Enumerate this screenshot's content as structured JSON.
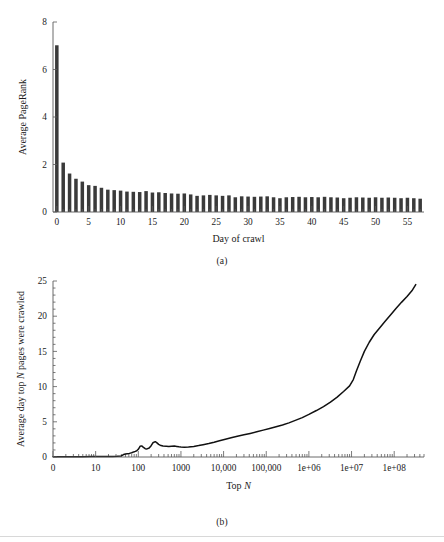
{
  "figure": {
    "panel_a_caption": "(a)",
    "panel_b_caption": "(b)"
  },
  "chart_data": [
    {
      "id": "panel-a",
      "type": "bar",
      "title": "",
      "xlabel": "Day of crawl",
      "ylabel": "Average PageRank",
      "xlim": [
        -0.6,
        57.6
      ],
      "ylim": [
        0,
        8
      ],
      "grid": false,
      "legend": "none",
      "bar_color": "#3a3a3a",
      "xticks": [
        0,
        5,
        10,
        15,
        20,
        25,
        30,
        35,
        40,
        45,
        50,
        55
      ],
      "xticklabels": [
        "0",
        "5",
        "10",
        "15",
        "20",
        "25",
        "30",
        "35",
        "40",
        "45",
        "50",
        "55"
      ],
      "xminorticks": [
        1,
        2,
        3,
        4,
        6,
        7,
        8,
        9,
        11,
        12,
        13,
        14,
        16,
        17,
        18,
        19,
        21,
        22,
        23,
        24,
        26,
        27,
        28,
        29,
        31,
        32,
        33,
        34,
        36,
        37,
        38,
        39,
        41,
        42,
        43,
        44,
        46,
        47,
        48,
        49,
        51,
        52,
        53,
        54,
        56,
        57
      ],
      "yticks": [
        0,
        2,
        4,
        6,
        8
      ],
      "yticklabels": [
        "0",
        "2",
        "4",
        "6",
        "8"
      ],
      "categories": [
        0,
        1,
        2,
        3,
        4,
        5,
        6,
        7,
        8,
        9,
        10,
        11,
        12,
        13,
        14,
        15,
        16,
        17,
        18,
        19,
        20,
        21,
        22,
        23,
        24,
        25,
        26,
        27,
        28,
        29,
        30,
        31,
        32,
        33,
        34,
        35,
        36,
        37,
        38,
        39,
        40,
        41,
        42,
        43,
        44,
        45,
        46,
        47,
        48,
        49,
        50,
        51,
        52,
        53,
        54,
        55,
        56,
        57
      ],
      "values": [
        7.02,
        2.08,
        1.62,
        1.4,
        1.28,
        1.13,
        1.1,
        1.02,
        0.94,
        0.92,
        0.9,
        0.86,
        0.85,
        0.84,
        0.88,
        0.82,
        0.83,
        0.8,
        0.78,
        0.77,
        0.78,
        0.74,
        0.68,
        0.7,
        0.72,
        0.7,
        0.68,
        0.7,
        0.62,
        0.66,
        0.65,
        0.64,
        0.65,
        0.66,
        0.62,
        0.58,
        0.62,
        0.63,
        0.64,
        0.62,
        0.63,
        0.62,
        0.64,
        0.62,
        0.61,
        0.58,
        0.6,
        0.62,
        0.61,
        0.6,
        0.62,
        0.6,
        0.61,
        0.6,
        0.58,
        0.6,
        0.58,
        0.56
      ]
    },
    {
      "id": "panel-b",
      "type": "line",
      "title": "",
      "xlabel": "Top N",
      "ylabel": "Average day top N pages were crawled",
      "xscale": "log",
      "xlim": [
        1,
        500000000
      ],
      "ylim": [
        0,
        25
      ],
      "grid": false,
      "legend": "none",
      "line_color": "#111111",
      "xticks": [
        1,
        10,
        100,
        1000,
        10000,
        100000,
        1000000,
        10000000,
        100000000
      ],
      "xticklabels": [
        "0",
        "10",
        "100",
        "1000",
        "10,000",
        "100,000",
        "1e+06",
        "1e+07",
        "1e+08"
      ],
      "yticks": [
        0,
        5,
        10,
        15,
        20,
        25
      ],
      "yticklabels": [
        "0",
        "5",
        "10",
        "15",
        "20",
        "25"
      ],
      "x": [
        1,
        2,
        3,
        5,
        8,
        12,
        18,
        25,
        32,
        40,
        45,
        50,
        55,
        60,
        65,
        70,
        78,
        85,
        92,
        100,
        110,
        120,
        130,
        145,
        160,
        180,
        200,
        220,
        250,
        270,
        300,
        340,
        380,
        450,
        520,
        600,
        700,
        800,
        900,
        1000,
        1200,
        1500,
        2000,
        2600,
        3300,
        4500,
        6000,
        8000,
        11000,
        15000,
        21000,
        30000,
        42000,
        60000,
        85000,
        120000,
        170000,
        240000,
        340000,
        480000,
        700000,
        1000000,
        1500000,
        2200000,
        3200000,
        4600000,
        6500000,
        9000000,
        11000000,
        13000000,
        16000000,
        20000000,
        26000000,
        34000000,
        45000000,
        60000000,
        80000000,
        110000000,
        150000000,
        200000000,
        260000000,
        320000000
      ],
      "y": [
        0.05,
        0.05,
        0.05,
        0.05,
        0.06,
        0.06,
        0.07,
        0.08,
        0.1,
        0.15,
        0.35,
        0.42,
        0.45,
        0.48,
        0.55,
        0.6,
        0.72,
        0.8,
        0.88,
        1.1,
        1.52,
        1.58,
        1.4,
        1.18,
        1.15,
        1.28,
        1.6,
        2.02,
        2.18,
        2.05,
        1.8,
        1.62,
        1.55,
        1.52,
        1.5,
        1.54,
        1.56,
        1.5,
        1.45,
        1.42,
        1.4,
        1.42,
        1.5,
        1.62,
        1.75,
        1.92,
        2.1,
        2.3,
        2.52,
        2.72,
        2.95,
        3.15,
        3.35,
        3.58,
        3.82,
        4.05,
        4.3,
        4.55,
        4.85,
        5.2,
        5.6,
        6.05,
        6.6,
        7.15,
        7.8,
        8.5,
        9.3,
        10.1,
        11.0,
        12.2,
        13.6,
        15.0,
        16.3,
        17.4,
        18.3,
        19.2,
        20.1,
        21.1,
        22.0,
        22.8,
        23.6,
        24.5
      ]
    }
  ]
}
